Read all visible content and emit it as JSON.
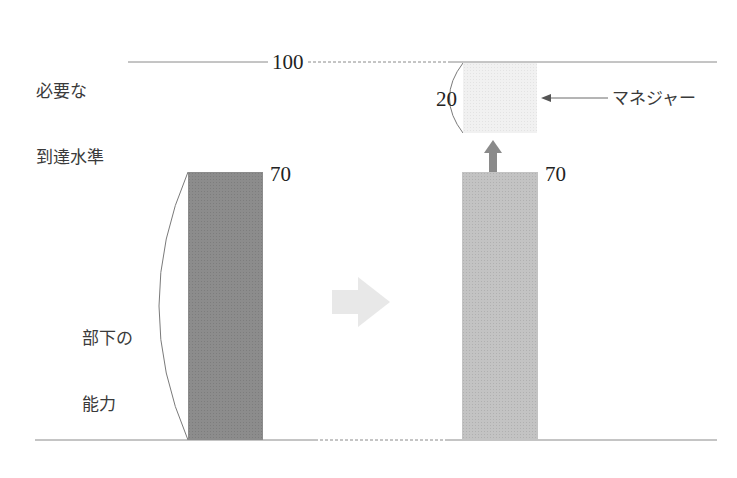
{
  "diagram": {
    "target_label_line1": "必要な",
    "target_label_line2": "到達水準",
    "target_value": "100",
    "subordinate_label_line1": "部下の",
    "subordinate_label_line2": "能力",
    "left_bar_value": "70",
    "right_bar_value": "70",
    "manager_contribution_value": "20",
    "manager_label": "マネジャー"
  },
  "colors": {
    "left_bar": "#8c8c8c",
    "right_bar": "#c3c3c3",
    "manager_box": "#f1f1f1",
    "up_arrow": "#8a8a8a",
    "transition_arrow": "#e6e6e6",
    "lines": "#9a9a9a"
  }
}
